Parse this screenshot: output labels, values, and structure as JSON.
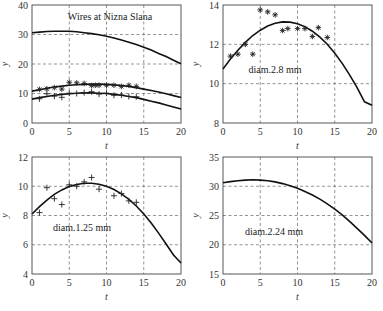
{
  "chart_data": [
    {
      "id": "tl",
      "type": "line",
      "title": "Wires at Nizna Slana",
      "annotation": "Wires at Nizna Slana",
      "xlabel": "t",
      "ylabel": "y",
      "xlim": [
        0,
        20
      ],
      "ylim": [
        0,
        40
      ],
      "xticks": [
        0,
        5,
        10,
        15,
        20
      ],
      "yticks": [
        0,
        10,
        20,
        30,
        40
      ],
      "grid": true,
      "box": [
        32,
        5,
        181,
        123
      ],
      "annotation_pos": [
        110,
        20
      ],
      "series": [
        {
          "name": "diam.2.24 mm fit",
          "style": "line",
          "x": [
            0,
            1,
            2,
            3,
            4,
            5,
            6,
            7,
            8,
            9,
            10,
            11,
            12,
            13,
            14,
            15,
            16,
            17,
            18,
            19,
            20
          ],
          "y": [
            30.6,
            30.8,
            31.0,
            31.1,
            31.1,
            31.1,
            30.9,
            30.6,
            30.3,
            29.9,
            29.4,
            28.8,
            28.1,
            27.4,
            26.6,
            25.7,
            24.7,
            23.6,
            22.5,
            21.3,
            20.1
          ]
        },
        {
          "name": "diam.2.8 mm fit",
          "style": "line",
          "x": [
            0,
            1,
            2,
            3,
            4,
            5,
            6,
            7,
            8,
            9,
            10,
            11,
            12,
            13,
            14,
            15,
            16,
            17,
            18,
            19,
            20
          ],
          "y": [
            10.8,
            11.3,
            11.8,
            12.2,
            12.5,
            12.8,
            13.0,
            13.1,
            13.2,
            13.2,
            13.1,
            12.9,
            12.7,
            12.4,
            12.0,
            11.5,
            11.0,
            10.5,
            9.9,
            9.3,
            8.6
          ]
        },
        {
          "name": "diam.2.8 mm data",
          "style": "star",
          "x": [
            1,
            2,
            3,
            4,
            5,
            6,
            7,
            8,
            8.5,
            9,
            10,
            11,
            12,
            13,
            14
          ],
          "y": [
            11.4,
            11.6,
            12.0,
            11.5,
            13.8,
            13.6,
            13.4,
            12.7,
            12.8,
            12.8,
            12.8,
            12.8,
            12.4,
            12.8,
            12.4
          ]
        },
        {
          "name": "diam.1.25 mm fit",
          "style": "line",
          "x": [
            0,
            1,
            2,
            3,
            4,
            5,
            6,
            7,
            8,
            9,
            10,
            11,
            12,
            13,
            14,
            15,
            16,
            17,
            18,
            19,
            20
          ],
          "y": [
            8.1,
            8.6,
            9.0,
            9.4,
            9.7,
            9.9,
            10.1,
            10.2,
            10.2,
            10.1,
            10.0,
            9.7,
            9.4,
            9.0,
            8.6,
            8.0,
            7.4,
            6.8,
            6.1,
            5.4,
            4.7
          ]
        },
        {
          "name": "diam.1.25 mm data",
          "style": "plus",
          "x": [
            1,
            2,
            3,
            4,
            5,
            6,
            7,
            8,
            9,
            10,
            11,
            12,
            13,
            14
          ],
          "y": [
            8.2,
            9.9,
            9.1,
            8.7,
            10.1,
            10.0,
            10.3,
            10.6,
            9.8,
            10.1,
            9.4,
            9.5,
            9.0,
            8.9
          ]
        }
      ]
    },
    {
      "id": "tr",
      "type": "line",
      "annotation": "diam.2.8 mm",
      "xlabel": "t",
      "ylabel": "y",
      "xlim": [
        0,
        20
      ],
      "ylim": [
        8,
        14
      ],
      "xticks": [
        0,
        5,
        10,
        15,
        20
      ],
      "yticks": [
        8,
        10,
        12,
        14
      ],
      "grid": true,
      "box": [
        223,
        5,
        372,
        123
      ],
      "annotation_pos": [
        275,
        73
      ],
      "series": [
        {
          "name": "fit",
          "style": "line",
          "x": [
            0,
            1,
            2,
            3,
            4,
            5,
            6,
            7,
            8,
            9,
            10,
            11,
            12,
            13,
            14,
            15,
            16,
            17,
            18,
            19,
            20
          ],
          "y": [
            10.75,
            11.25,
            11.7,
            12.1,
            12.45,
            12.72,
            12.93,
            13.07,
            13.14,
            13.13,
            13.05,
            12.9,
            12.67,
            12.37,
            12.0,
            11.55,
            11.03,
            10.45,
            9.8,
            9.08,
            8.9
          ]
        },
        {
          "name": "data",
          "style": "star",
          "x": [
            1,
            2,
            3,
            4,
            5,
            6,
            7,
            8,
            8.7,
            10,
            11,
            12,
            12.8,
            14
          ],
          "y": [
            11.4,
            11.5,
            12.0,
            11.5,
            13.75,
            13.65,
            13.5,
            12.7,
            12.8,
            12.8,
            12.8,
            12.4,
            12.85,
            12.35
          ]
        }
      ]
    },
    {
      "id": "bl",
      "type": "line",
      "annotation": "diam.1.25 mm",
      "xlabel": "t",
      "ylabel": "y",
      "xlim": [
        0,
        20
      ],
      "ylim": [
        4,
        12
      ],
      "xticks": [
        0,
        5,
        10,
        15,
        20
      ],
      "yticks": [
        4,
        6,
        8,
        10,
        12
      ],
      "grid": true,
      "box": [
        32,
        157,
        181,
        274
      ],
      "annotation_pos": [
        82,
        231
      ],
      "series": [
        {
          "name": "fit",
          "style": "line",
          "x": [
            0,
            1,
            2,
            3,
            4,
            5,
            6,
            7,
            8,
            9,
            10,
            11,
            12,
            13,
            14,
            15,
            16,
            17,
            18,
            19,
            20
          ],
          "y": [
            8.1,
            8.6,
            9.05,
            9.45,
            9.75,
            9.98,
            10.12,
            10.2,
            10.2,
            10.14,
            10.0,
            9.78,
            9.48,
            9.1,
            8.65,
            8.1,
            7.48,
            6.8,
            6.05,
            5.3,
            4.75
          ]
        },
        {
          "name": "data",
          "style": "plus",
          "x": [
            1,
            2,
            3,
            4,
            5,
            6,
            7,
            8,
            9,
            11,
            12,
            13,
            14
          ],
          "y": [
            8.2,
            9.9,
            9.15,
            8.75,
            10.1,
            10.0,
            10.3,
            10.6,
            9.8,
            9.35,
            9.5,
            9.0,
            8.9
          ]
        }
      ]
    },
    {
      "id": "br",
      "type": "line",
      "annotation": "diam.2.24 mm",
      "xlabel": "t",
      "ylabel": "y",
      "xlim": [
        0,
        20
      ],
      "ylim": [
        15,
        35
      ],
      "xticks": [
        0,
        5,
        10,
        15,
        20
      ],
      "yticks": [
        15,
        20,
        25,
        30,
        35
      ],
      "grid": true,
      "box": [
        223,
        157,
        372,
        274
      ],
      "annotation_pos": [
        274,
        235
      ],
      "series": [
        {
          "name": "fit",
          "style": "line",
          "x": [
            0,
            1,
            2,
            3,
            4,
            5,
            6,
            7,
            8,
            9,
            10,
            11,
            12,
            13,
            14,
            15,
            16,
            17,
            18,
            19,
            20
          ],
          "y": [
            30.6,
            30.8,
            30.95,
            31.05,
            31.1,
            31.05,
            30.95,
            30.75,
            30.45,
            30.1,
            29.65,
            29.1,
            28.5,
            27.8,
            27.0,
            26.1,
            25.1,
            24.0,
            22.8,
            21.6,
            20.3
          ]
        }
      ]
    }
  ]
}
